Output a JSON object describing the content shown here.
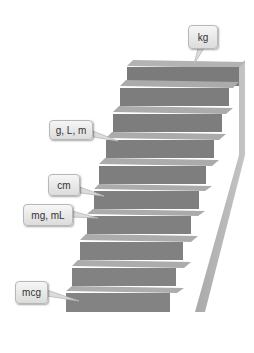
{
  "diagram": {
    "type": "staircase",
    "step_count": 10,
    "colors": {
      "riser": "#7d7d7d",
      "tread": "#ababab",
      "side": "#b5b5b5",
      "callout_bg": "#e8e8e8",
      "callout_border": "#b8b8b8"
    },
    "labels": [
      {
        "id": "kg",
        "text": "kg",
        "step": 10
      },
      {
        "id": "g-l-m",
        "text": "g, L, m",
        "step": 7
      },
      {
        "id": "cm",
        "text": "cm",
        "step": 5
      },
      {
        "id": "mg-ml",
        "text": "mg, mL",
        "step": 4
      },
      {
        "id": "mcg",
        "text": "mcg",
        "step": 1
      }
    ]
  }
}
